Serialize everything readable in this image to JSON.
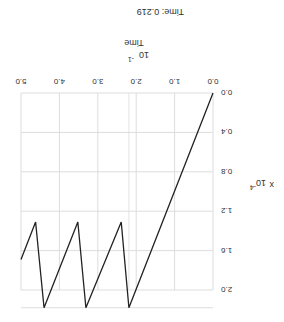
{
  "header": {
    "time_label": "Time: 0.219"
  },
  "chart_data": {
    "type": "line",
    "title": "Time: 0.219",
    "xlabel": "Time",
    "x_scale": "10^-1",
    "ylabel": "x",
    "y_scale": "10^-4",
    "xlim": [
      0.0,
      5.0
    ],
    "ylim": [
      0.0,
      2.0
    ],
    "x_ticks": [
      "0.0",
      "1.0",
      "2.0",
      "3.0",
      "4.0",
      "5.0"
    ],
    "y_ticks": [
      "0.0",
      "0.4",
      "0.8",
      "1.2",
      "1.6",
      "2.0"
    ],
    "grid": true,
    "series": [
      {
        "name": "x",
        "x": [
          0.0,
          2.19,
          2.39,
          3.31,
          3.52,
          4.4,
          4.62,
          5.0
        ],
        "y": [
          0.0,
          2.18,
          1.31,
          2.18,
          1.31,
          2.18,
          1.31,
          1.69
        ]
      }
    ]
  },
  "labels": {
    "time_axis": "Time",
    "time_exp_base": "10",
    "time_exp": "-1",
    "x_axis": "x",
    "x_exp_base": "10",
    "x_exp": "-4"
  }
}
